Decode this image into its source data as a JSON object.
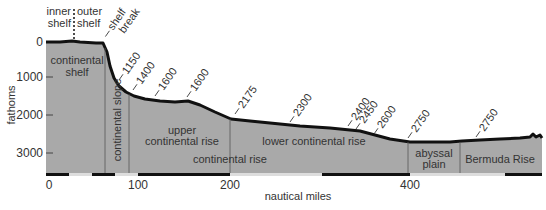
{
  "y_axis": {
    "label": "fathoms",
    "ticks": [
      "0",
      "1000",
      "2000",
      "3000"
    ]
  },
  "x_axis": {
    "label": "nautical miles",
    "ticks": [
      "0",
      "100",
      "200",
      "400"
    ]
  },
  "top_labels": {
    "inner_shelf": [
      "inner",
      "shelf"
    ],
    "outer_shelf": [
      "outer",
      "shelf"
    ],
    "shelf_break": [
      "shelf",
      "break"
    ]
  },
  "depth_labels": [
    "1150",
    "1400",
    "1600",
    "1600",
    "2175",
    "2300",
    "2400",
    "2450",
    "2600",
    "2750",
    "2750"
  ],
  "regions": {
    "continental_shelf": [
      "continental",
      "shelf"
    ],
    "continental_slope": "continental slope",
    "upper_continental_rise": [
      "upper",
      "continental rise"
    ],
    "continental_rise": "continental rise",
    "lower_continental_rise": "lower continental rise",
    "abyssal_plain": [
      "abyssal",
      "plain"
    ],
    "bermuda_rise": "Bermuda Rise"
  },
  "colors": {
    "seafloor_fill": "#a9a9a9",
    "profile_line": "#111111",
    "text": "#333333"
  }
}
